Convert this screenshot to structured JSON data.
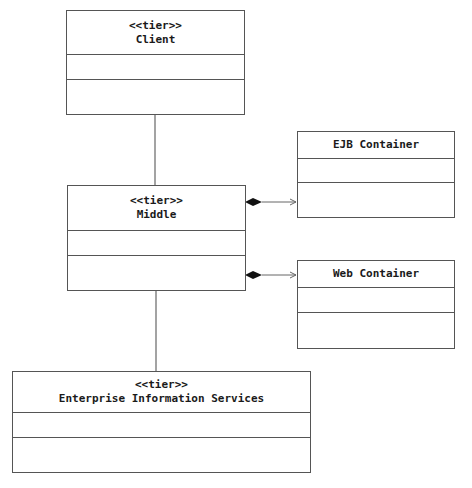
{
  "diagram": {
    "type": "UML class diagram",
    "nodes": [
      {
        "id": "client",
        "stereotype": "<<tier>>",
        "name": "Client"
      },
      {
        "id": "middle",
        "stereotype": "<<tier>>",
        "name": "Middle"
      },
      {
        "id": "ejb",
        "stereotype": "",
        "name": "EJB Container"
      },
      {
        "id": "web",
        "stereotype": "",
        "name": "Web Container"
      },
      {
        "id": "eis",
        "stereotype": "<<tier>>",
        "name": "Enterprise Information Services"
      }
    ],
    "edges": [
      {
        "from": "client",
        "to": "middle",
        "type": "association"
      },
      {
        "from": "middle",
        "to": "eis",
        "type": "association"
      },
      {
        "from": "middle",
        "to": "ejb",
        "type": "composition-navigable"
      },
      {
        "from": "middle",
        "to": "web",
        "type": "composition-navigable"
      }
    ]
  }
}
